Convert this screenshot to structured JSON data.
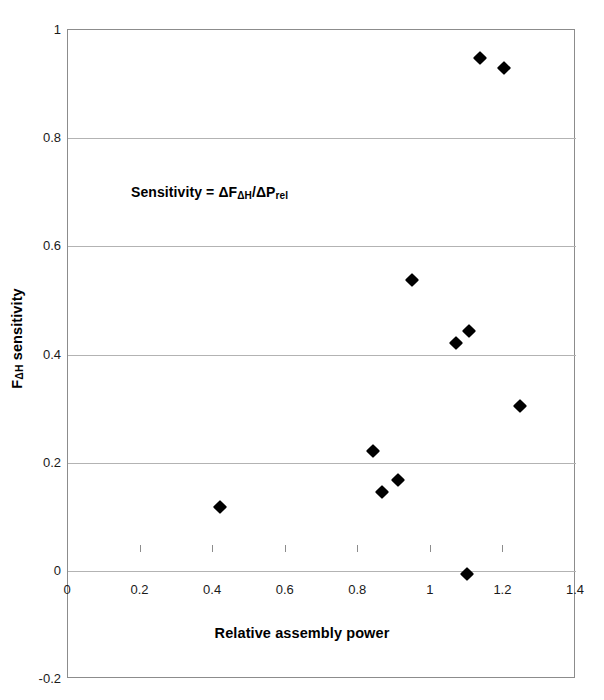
{
  "chart_data": {
    "type": "scatter",
    "title": "",
    "xlabel": "Relative assembly power",
    "ylabel": "FΔH sensitivity",
    "ylabel_base": "F",
    "ylabel_sub": "ΔH",
    "ylabel_rest": " sensitivity",
    "annotation": "Sensitivity = ΔFΔH/ΔPrel",
    "annotation_parts": {
      "a": "Sensitivity = ΔF",
      "sub1": "ΔH",
      "b": "/ΔP",
      "sub2": "rel"
    },
    "xlim": [
      0,
      1.4
    ],
    "ylim": [
      -0.2,
      1
    ],
    "xticks": [
      0,
      0.2,
      0.4,
      0.6,
      0.8,
      1,
      1.2,
      1.4
    ],
    "xticklabels": [
      "0",
      "0.2",
      "0.4",
      "0.6",
      "0.8",
      "1",
      "1.2",
      "1.4"
    ],
    "yticks": [
      -0.2,
      0,
      0.2,
      0.4,
      0.6,
      0.8,
      1
    ],
    "yticklabels": [
      "-0.2",
      "0",
      "0.2",
      "0.4",
      "0.6",
      "0.8",
      "1"
    ],
    "grid": "horizontal",
    "legend": "none",
    "marker": "diamond",
    "marker_color": "#000000",
    "frame_color": "#8c8c8c",
    "gridline_color": "#b3b3b3",
    "series": [
      {
        "name": "FΔH sensitivity",
        "points": [
          {
            "x": 0.42,
            "y": 0.118
          },
          {
            "x": 0.84,
            "y": 0.222
          },
          {
            "x": 0.865,
            "y": 0.145
          },
          {
            "x": 0.91,
            "y": 0.168
          },
          {
            "x": 0.947,
            "y": 0.537
          },
          {
            "x": 1.07,
            "y": 0.421
          },
          {
            "x": 1.105,
            "y": 0.444
          },
          {
            "x": 1.1,
            "y": -0.006
          },
          {
            "x": 1.135,
            "y": 0.949
          },
          {
            "x": 1.202,
            "y": 0.929
          },
          {
            "x": 1.247,
            "y": 0.304
          }
        ]
      }
    ]
  }
}
